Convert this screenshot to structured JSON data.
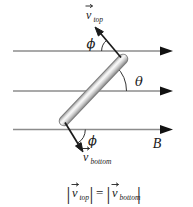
{
  "diagram": {
    "background": "#ffffff",
    "field": {
      "label": "B",
      "line_color": "#8c8c8c",
      "arrowhead_color": "#111111"
    },
    "rod": {
      "outline_color": "#7d7d7d",
      "edge_color": "#9e9e9e",
      "highlight_color": "#f8f8f8"
    },
    "vectors": {
      "color": "#1a1a1a",
      "top": {
        "symbol": "v",
        "subscript": "top"
      },
      "bottom": {
        "symbol": "v",
        "subscript": "bottom"
      }
    },
    "angles": {
      "phi_top": "ϕ",
      "theta": "θ",
      "phi_bottom": "ϕ"
    },
    "equation": {
      "bar": "|",
      "lhs_symbol": "v",
      "lhs_subscript": "top",
      "equals": "=",
      "rhs_symbol": "v",
      "rhs_subscript": "bottom"
    }
  }
}
